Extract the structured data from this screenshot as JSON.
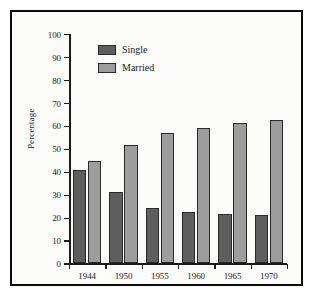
{
  "chart_data": {
    "type": "bar",
    "title": "",
    "subtitle": "",
    "xlabel": "",
    "ylabel": "Percentage",
    "categories": [
      "1944",
      "1950",
      "1955",
      "1960",
      "1965",
      "1970"
    ],
    "series": [
      {
        "name": "Single",
        "color": "#5e5e5e",
        "values": [
          40.5,
          31,
          24,
          22.5,
          21.5,
          21
        ]
      },
      {
        "name": "Married",
        "color": "#9d9d9d",
        "values": [
          44.5,
          51.5,
          57,
          59,
          61,
          62.5
        ]
      }
    ],
    "ylim": [
      0,
      100
    ],
    "ytick_labels": [
      "100",
      "90",
      "80",
      "70",
      "60",
      "50",
      "40",
      "30",
      "20",
      "10",
      "0"
    ],
    "ytick_values": [
      100,
      90,
      80,
      70,
      60,
      50,
      40,
      30,
      20,
      10,
      0
    ],
    "grid": false,
    "legend_position": "top-left-inside",
    "frame": true,
    "frame_color": "#0a0a0a",
    "background": "#fbfbf9"
  }
}
